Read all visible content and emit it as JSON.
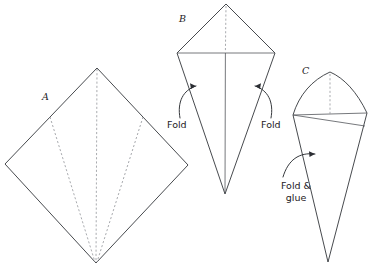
{
  "figure": {
    "background_color": "#ffffff",
    "line_color": "#32353a",
    "crease_color": "#9a9ca1",
    "text_color": "#1d2024",
    "width": 370,
    "height": 270
  },
  "steps": [
    {
      "id": "A",
      "label": "A",
      "label_x": 42,
      "label_y": 100,
      "description": "Square sheet rotated as a diamond with dashed fold creases"
    },
    {
      "id": "B",
      "label": "B",
      "label_x": 179,
      "label_y": 22,
      "description": "Kite shape after first folds, with horizontal crease"
    },
    {
      "id": "C",
      "label": "C",
      "label_x": 302,
      "label_y": 74,
      "description": "Finished cone shape after folding and gluing"
    }
  ],
  "annotations": [
    {
      "id": "fold-left",
      "text": "Fold",
      "x": 185,
      "y": 128,
      "anchor": "start"
    },
    {
      "id": "fold-right",
      "text": "Fold",
      "x": 261,
      "y": 128,
      "anchor": "start"
    },
    {
      "id": "fold-and-glue",
      "lines": [
        "Fold &",
        "glue"
      ],
      "line1": "Fold &",
      "line2": "glue",
      "x": 296,
      "y": 189,
      "anchor": "middle"
    }
  ],
  "geometry": {
    "diamond_a": {
      "top": [
        97,
        68
      ],
      "right": [
        188,
        165
      ],
      "bottom": [
        96,
        263
      ],
      "left": [
        5,
        164
      ],
      "crease_center": "97,68 to 96,263",
      "crease_left": "50,117 to 96,263",
      "crease_right": "143,117 to 96,263"
    },
    "kite_b": {
      "top": [
        226,
        4
      ],
      "left": [
        177,
        53
      ],
      "right": [
        275,
        53
      ],
      "bottom": [
        225,
        194
      ]
    },
    "cone_c": {
      "apex": [
        330,
        72
      ],
      "left": [
        293,
        115
      ],
      "right": [
        367,
        113
      ],
      "bottom": [
        328,
        262
      ]
    }
  }
}
